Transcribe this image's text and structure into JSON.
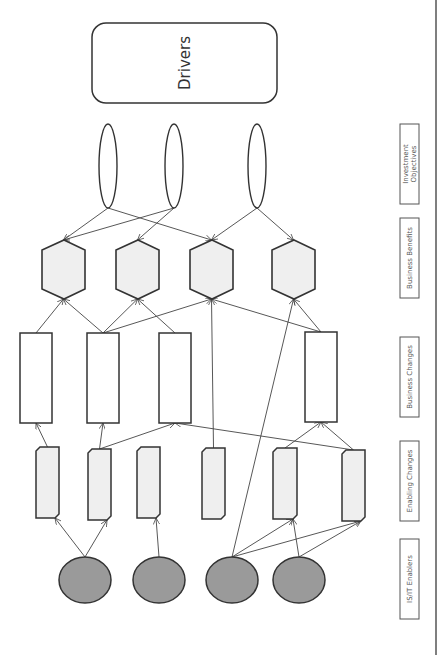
{
  "drivers": {
    "label": "Drivers"
  },
  "row_labels": {
    "investment_objectives": [
      "Investment",
      "Objectives"
    ],
    "business_benefits": "Business Benefits",
    "business_changes": "Business Changes",
    "enabling_changes": "Enabling Changes",
    "is_it_enablers": "IS/IT Enablers"
  },
  "colors": {
    "stroke": "#333333",
    "line": "#444444",
    "hexagon_fill": "#efefef",
    "enabling_fill": "#efefef",
    "enabler_fill": "#9a9a9a",
    "label_text": "#555555"
  },
  "nodes": {
    "investment_objectives": [
      "io1",
      "io2",
      "io3"
    ],
    "business_benefits": [
      "bb1",
      "bb2",
      "bb3",
      "bb4"
    ],
    "business_changes": [
      "bc1",
      "bc2",
      "bc3",
      "bc4"
    ],
    "enabling_changes": [
      "ec1",
      "ec2",
      "ec3",
      "ec4",
      "ec5",
      "ec6"
    ],
    "is_it_enablers": [
      "en1",
      "en2",
      "en3",
      "en4"
    ]
  },
  "edges": [
    [
      "io1",
      "bb1"
    ],
    [
      "io1",
      "bb3"
    ],
    [
      "io2",
      "bb1"
    ],
    [
      "io2",
      "bb2"
    ],
    [
      "io3",
      "bb3"
    ],
    [
      "io3",
      "bb4"
    ],
    [
      "bc1",
      "bb1"
    ],
    [
      "bc2",
      "bb1"
    ],
    [
      "bc2",
      "bb2"
    ],
    [
      "bc2",
      "bb3"
    ],
    [
      "bc3",
      "bb2"
    ],
    [
      "ec4",
      "bb3"
    ],
    [
      "bc4",
      "bb3"
    ],
    [
      "bc4",
      "bb4"
    ],
    [
      "en3",
      "bb4"
    ],
    [
      "ec1",
      "bc1"
    ],
    [
      "ec2",
      "bc2"
    ],
    [
      "ec2",
      "bc3"
    ],
    [
      "ec6",
      "bc3"
    ],
    [
      "ec5",
      "bc4"
    ],
    [
      "ec6",
      "bc4"
    ],
    [
      "en1",
      "ec1"
    ],
    [
      "en1",
      "ec2"
    ],
    [
      "en2",
      "ec3"
    ],
    [
      "en3",
      "ec5"
    ],
    [
      "en3",
      "ec6"
    ],
    [
      "en4",
      "ec5"
    ],
    [
      "en4",
      "ec6"
    ]
  ]
}
